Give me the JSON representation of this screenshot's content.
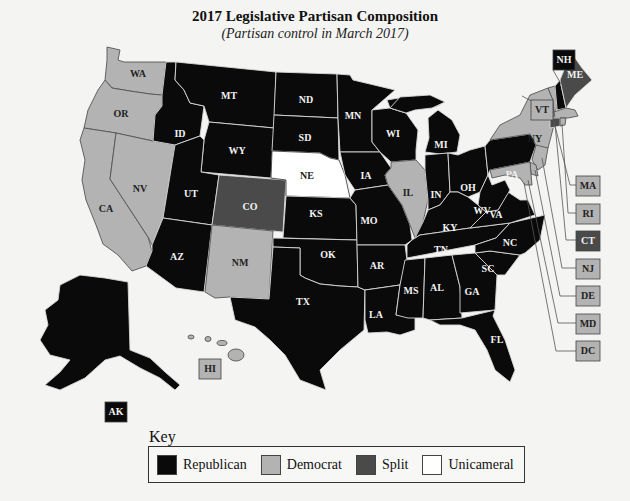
{
  "header": {
    "title": "2017 Legislative Partisan Composition",
    "subtitle": "(Partisan control in March 2017)"
  },
  "colors": {
    "republican": "#0a0a0a",
    "democrat": "#b3b3b3",
    "split": "#4a4a4a",
    "unicameral": "#ffffff"
  },
  "key": {
    "title": "Key",
    "items": [
      {
        "label": "Republican",
        "category": "republican"
      },
      {
        "label": "Democrat",
        "category": "democrat"
      },
      {
        "label": "Split",
        "category": "split"
      },
      {
        "label": "Unicameral",
        "category": "unicameral"
      }
    ]
  },
  "states": {
    "WA": "democrat",
    "OR": "democrat",
    "CA": "democrat",
    "NV": "democrat",
    "ID": "republican",
    "MT": "republican",
    "WY": "republican",
    "UT": "republican",
    "AZ": "republican",
    "CO": "split",
    "NM": "democrat",
    "ND": "republican",
    "SD": "republican",
    "NE": "unicameral",
    "KS": "republican",
    "OK": "republican",
    "TX": "republican",
    "MN": "republican",
    "IA": "republican",
    "MO": "republican",
    "AR": "republican",
    "LA": "republican",
    "WI": "republican",
    "IL": "democrat",
    "MI": "republican",
    "IN": "republican",
    "OH": "republican",
    "KY": "republican",
    "TN": "republican",
    "MS": "republican",
    "AL": "republican",
    "GA": "republican",
    "FL": "republican",
    "SC": "republican",
    "NC": "republican",
    "VA": "republican",
    "WV": "republican",
    "PA": "republican",
    "NY": "democrat",
    "VT": "democrat",
    "NH": "republican",
    "ME": "split",
    "MA": "democrat",
    "RI": "democrat",
    "CT": "split",
    "NJ": "democrat",
    "DE": "democrat",
    "MD": "democrat",
    "DC": "democrat",
    "AK": "republican",
    "HI": "democrat"
  },
  "labels": {
    "WA": "WA",
    "OR": "OR",
    "CA": "CA",
    "NV": "NV",
    "ID": "ID",
    "MT": "MT",
    "WY": "WY",
    "UT": "UT",
    "AZ": "AZ",
    "CO": "CO",
    "NM": "NM",
    "ND": "ND",
    "SD": "SD",
    "NE": "NE",
    "KS": "KS",
    "OK": "OK",
    "TX": "TX",
    "MN": "MN",
    "IA": "IA",
    "MO": "MO",
    "AR": "AR",
    "LA": "LA",
    "WI": "WI",
    "IL": "IL",
    "MI": "MI",
    "IN": "IN",
    "OH": "OH",
    "KY": "KY",
    "TN": "TN",
    "MS": "MS",
    "AL": "AL",
    "GA": "GA",
    "FL": "FL",
    "SC": "SC",
    "NC": "NC",
    "VA": "VA",
    "WV": "WV",
    "PA": "PA",
    "NY": "NY",
    "VT": "VT",
    "NH": "NH",
    "ME": "ME",
    "MA": "MA",
    "RI": "RI",
    "CT": "CT",
    "NJ": "NJ",
    "DE": "DE",
    "MD": "MD",
    "DC": "DC",
    "AK": "AK",
    "HI": "HI"
  },
  "chart_data": {
    "type": "choropleth",
    "title": "2017 Legislative Partisan Composition",
    "subtitle": "(Partisan control in March 2017)",
    "legend": [
      "Republican",
      "Democrat",
      "Split",
      "Unicameral"
    ],
    "legend_position": "bottom",
    "values": {
      "Republican": [
        "ID",
        "MT",
        "WY",
        "UT",
        "AZ",
        "ND",
        "SD",
        "KS",
        "OK",
        "TX",
        "MN",
        "IA",
        "MO",
        "AR",
        "LA",
        "WI",
        "MI",
        "IN",
        "OH",
        "KY",
        "TN",
        "MS",
        "AL",
        "GA",
        "FL",
        "SC",
        "NC",
        "VA",
        "WV",
        "PA",
        "NH",
        "AK"
      ],
      "Democrat": [
        "WA",
        "OR",
        "CA",
        "NV",
        "NM",
        "IL",
        "NY",
        "VT",
        "MA",
        "RI",
        "NJ",
        "DE",
        "MD",
        "DC",
        "HI"
      ],
      "Split": [
        "CO",
        "ME",
        "CT"
      ],
      "Unicameral": [
        "NE"
      ]
    }
  }
}
